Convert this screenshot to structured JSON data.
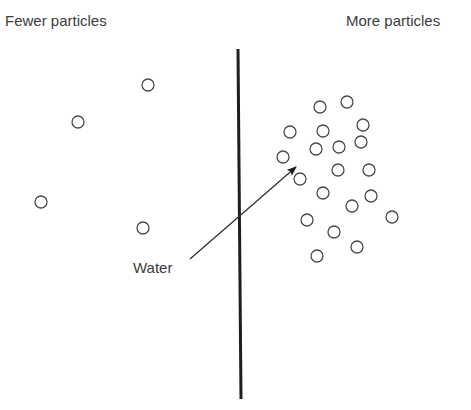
{
  "labels": {
    "left": "Fewer particles",
    "right": "More particles",
    "flow": "Water"
  },
  "colors": {
    "stroke": "#4a4a4a",
    "membrane": "#1e1e1e",
    "text": "#3c3c3c"
  },
  "membrane": {
    "x1": 238,
    "y1": 49,
    "x2": 241,
    "y2": 399,
    "width": 3
  },
  "arrow": {
    "x1": 190,
    "y1": 259,
    "x2": 296,
    "y2": 167
  },
  "particle_radius": 6,
  "particles_left": [
    {
      "x": 148,
      "y": 85
    },
    {
      "x": 78,
      "y": 122
    },
    {
      "x": 41,
      "y": 202
    },
    {
      "x": 143,
      "y": 228
    }
  ],
  "particles_right": [
    {
      "x": 320,
      "y": 107
    },
    {
      "x": 347,
      "y": 102
    },
    {
      "x": 290,
      "y": 132
    },
    {
      "x": 323,
      "y": 131
    },
    {
      "x": 363,
      "y": 125
    },
    {
      "x": 316,
      "y": 149
    },
    {
      "x": 339,
      "y": 147
    },
    {
      "x": 361,
      "y": 142
    },
    {
      "x": 283,
      "y": 157
    },
    {
      "x": 300,
      "y": 179
    },
    {
      "x": 338,
      "y": 170
    },
    {
      "x": 369,
      "y": 170
    },
    {
      "x": 323,
      "y": 193
    },
    {
      "x": 371,
      "y": 196
    },
    {
      "x": 352,
      "y": 206
    },
    {
      "x": 392,
      "y": 217
    },
    {
      "x": 307,
      "y": 220
    },
    {
      "x": 334,
      "y": 232
    },
    {
      "x": 357,
      "y": 247
    },
    {
      "x": 317,
      "y": 256
    }
  ]
}
